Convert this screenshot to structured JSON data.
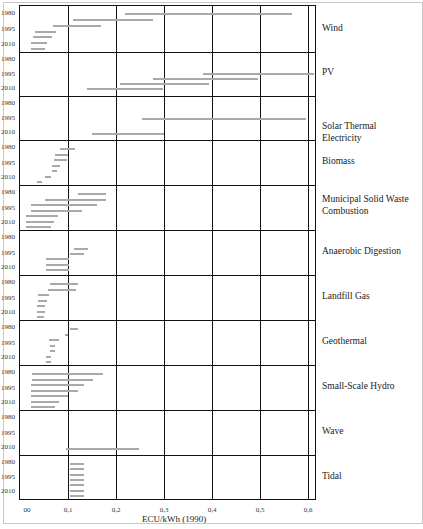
{
  "chart_data": {
    "type": "range-bar",
    "title": "",
    "xlabel": "ECU/kWh (1990)",
    "ylabel": "",
    "xlim": [
      0,
      0.62
    ],
    "x_ticks": [
      "00",
      "0,1",
      "0,2",
      "0,3",
      "0,4",
      "0,5",
      "0,6"
    ],
    "x_tick_values": [
      0,
      0.1,
      0.2,
      0.3,
      0.4,
      0.5,
      0.6
    ],
    "grid": true,
    "year_ticks": [
      "1980",
      "1995",
      "2010"
    ],
    "series_note": "Each technology panel shows horizontal cost-range bars (min–max ECU/kWh) for successive years from 1980 (top) to 2010 (bottom).",
    "panels": [
      {
        "name": "Wind",
        "bars": [
          [
            0.217,
            0.565
          ],
          [
            0.108,
            0.275
          ],
          [
            0.067,
            0.167
          ],
          [
            0.029,
            0.073
          ],
          [
            0.025,
            0.065
          ],
          [
            0.021,
            0.054
          ],
          [
            0.021,
            0.05
          ]
        ]
      },
      {
        "name": "PV",
        "bars": [
          [
            0.38,
            0.61
          ],
          [
            0.275,
            0.494
          ],
          [
            0.206,
            0.392
          ],
          [
            0.138,
            0.296
          ]
        ]
      },
      {
        "name": "Solar Thermal Electricity",
        "bars": [
          [
            0.252,
            0.594
          ],
          [
            0.148,
            0.298
          ]
        ]
      },
      {
        "name": "Biomass",
        "bars": [
          [
            0.081,
            0.113
          ],
          [
            0.071,
            0.098
          ],
          [
            0.069,
            0.096
          ],
          [
            0.065,
            0.081
          ],
          [
            0.065,
            0.075
          ],
          [
            0.05,
            0.063
          ],
          [
            0.033,
            0.044
          ]
        ]
      },
      {
        "name": "Municipal Solid Waste Combustion",
        "bars": [
          [
            0.119,
            0.177
          ],
          [
            0.05,
            0.177
          ],
          [
            0.021,
            0.158
          ],
          [
            0.021,
            0.127
          ],
          [
            0.01,
            0.077
          ],
          [
            0.01,
            0.069
          ],
          [
            0.01,
            0.063
          ]
        ]
      },
      {
        "name": "Anaerobic Digestion",
        "bars": [
          [
            0.11,
            0.14
          ],
          [
            0.102,
            0.131
          ],
          [
            0.052,
            0.1
          ],
          [
            0.052,
            0.1
          ],
          [
            0.052,
            0.1
          ]
        ]
      },
      {
        "name": "Landfill Gas",
        "bars": [
          [
            0.06,
            0.119
          ],
          [
            0.056,
            0.115
          ],
          [
            0.035,
            0.058
          ],
          [
            0.035,
            0.054
          ],
          [
            0.033,
            0.05
          ],
          [
            0.033,
            0.05
          ],
          [
            0.033,
            0.048
          ]
        ]
      },
      {
        "name": "Geothermal",
        "bars": [
          [
            0.102,
            0.119
          ],
          [
            0.092,
            0.098
          ],
          [
            0.058,
            0.079
          ],
          [
            0.06,
            0.071
          ],
          [
            0.06,
            0.071
          ],
          [
            0.052,
            0.063
          ],
          [
            0.052,
            0.063
          ]
        ]
      },
      {
        "name": "Small-Scale Hydro",
        "bars": [
          [
            0.023,
            0.171
          ],
          [
            0.023,
            0.15
          ],
          [
            0.021,
            0.131
          ],
          [
            0.021,
            0.119
          ],
          [
            0.021,
            0.098
          ],
          [
            0.021,
            0.079
          ],
          [
            0.021,
            0.071
          ]
        ]
      },
      {
        "name": "Wave",
        "bars": [
          [
            0.094,
            0.246
          ]
        ]
      },
      {
        "name": "Tidal",
        "bars": [
          [
            0.102,
            0.131
          ],
          [
            0.102,
            0.131
          ],
          [
            0.102,
            0.131
          ],
          [
            0.102,
            0.131
          ],
          [
            0.102,
            0.131
          ],
          [
            0.102,
            0.131
          ],
          [
            0.102,
            0.131
          ]
        ]
      }
    ]
  },
  "labels": {
    "xaxis_title": "ECU/kWh (1990)",
    "x_ticks": [
      "00",
      "0,1",
      "0,2",
      "0,3",
      "0,4",
      "0,5",
      "0,6"
    ],
    "year_1980": "1980",
    "year_1995": "1995",
    "year_2010": "2010",
    "categories": [
      "Wind",
      "PV",
      "Solar Thermal Electricity",
      "Biomass",
      "Municipal Solid Waste",
      "Combustion",
      "Anaerobic Digestion",
      "Landfill Gas",
      "Geothermal",
      "Small-Scale Hydro",
      "Wave",
      "Tidal"
    ]
  },
  "colors": {
    "bar": "#a9a9a9",
    "grid": "#111111",
    "frame": "#c8c8c8"
  }
}
